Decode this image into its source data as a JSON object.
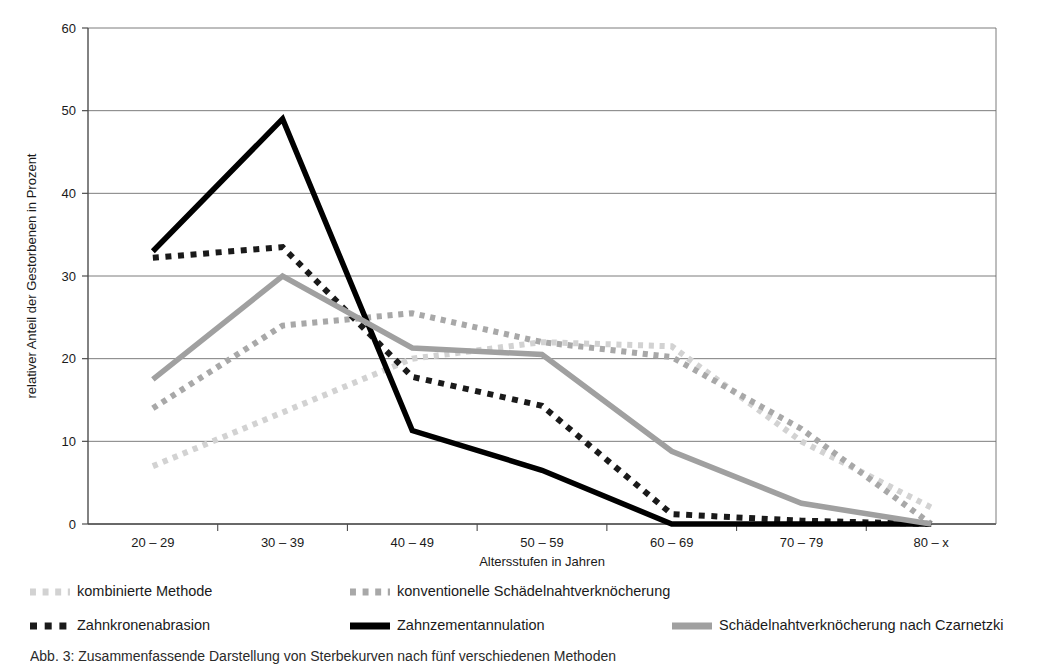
{
  "chart_data": {
    "type": "line",
    "title": "",
    "xlabel": "Altersstufen in Jahren",
    "ylabel": "relativer Anteil der Gestorbenen in Prozent",
    "categories": [
      "20 – 29",
      "30 – 39",
      "40 – 49",
      "50 – 59",
      "60 – 69",
      "70 – 79",
      "80 – x"
    ],
    "ylim": [
      0,
      60
    ],
    "yticks": [
      0,
      10,
      20,
      30,
      40,
      50,
      60
    ],
    "grid": "horizontal",
    "legend_position": "below",
    "series": [
      {
        "name": "kombinierte Methode",
        "style": "dotted",
        "color": "#d2d2d2",
        "values": [
          7,
          13.5,
          20,
          22,
          21.5,
          10,
          2
        ]
      },
      {
        "name": "konventionelle Schädelnahtverknöcherung",
        "style": "dotted",
        "color": "#a8a8a8",
        "values": [
          14,
          24,
          25.5,
          22,
          20.2,
          11.5,
          0
        ]
      },
      {
        "name": "Zahnkronenabrasion",
        "style": "dashed",
        "color": "#1a1a1a",
        "values": [
          32.2,
          33.5,
          17.8,
          14.3,
          1.2,
          0.4,
          0
        ]
      },
      {
        "name": "Zahnzementannulation",
        "style": "solid",
        "color": "#000000",
        "values": [
          33,
          49,
          11.3,
          6.5,
          0,
          0,
          0
        ]
      },
      {
        "name": "Schädelnahtverknöcherung nach Czarnetzki",
        "style": "solid",
        "color": "#a0a0a0",
        "values": [
          17.5,
          30,
          21.3,
          20.5,
          8.8,
          2.5,
          0
        ]
      }
    ]
  },
  "axes": {
    "y_title": "relativer Anteil der Gestorbenen in Prozent",
    "x_title": "Altersstufen in Jahren",
    "y_ticks": [
      "0",
      "10",
      "20",
      "30",
      "40",
      "50",
      "60"
    ],
    "x_ticks": [
      "20 – 29",
      "30 – 39",
      "40 – 49",
      "50 – 59",
      "60 – 69",
      "70 – 79",
      "80 – x"
    ]
  },
  "legend": {
    "items": [
      {
        "label": "kombinierte Methode",
        "marker": "dotted-light",
        "color": "#d2d2d2"
      },
      {
        "label": "konventionelle Schädelnahtverknöcherung",
        "marker": "dotted-mid",
        "color": "#a8a8a8"
      },
      {
        "label": "Zahnkronenabrasion",
        "marker": "dashed-dark",
        "color": "#1a1a1a"
      },
      {
        "label": "Zahnzementannulation",
        "marker": "solid-dark",
        "color": "#000000"
      },
      {
        "label": "Schädelnahtverknöcherung nach Czarnetzki",
        "marker": "solid-gray",
        "color": "#a0a0a0"
      }
    ]
  },
  "caption": {
    "text": "Abb. 3:   Zusammenfassende Darstellung von Sterbekurven nach fünf verschiedenen Methoden"
  },
  "colors": {
    "axis": "#4d4d4d",
    "grid": "#6e6e6e",
    "text": "#1a1a1a",
    "background": "#ffffff"
  }
}
